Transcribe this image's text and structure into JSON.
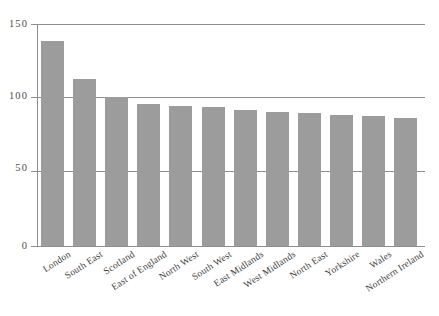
{
  "chart_data": {
    "type": "bar",
    "title": "",
    "subtitle": "",
    "xlabel": "",
    "ylabel": "",
    "ylim": [
      0,
      150
    ],
    "yticks": [
      0,
      50,
      100,
      150
    ],
    "ytick_labels": [
      "0",
      "50",
      "100",
      "150"
    ],
    "grid": "horizontal",
    "legend": "none",
    "bar_color": "#9c9c9c",
    "axis_color": "#8e8e8e",
    "background": "#ffffff",
    "categories": [
      "London",
      "South East",
      "Scotland",
      "East of England",
      "North West",
      "South West",
      "East Midlands",
      "West Midlands",
      "North East",
      "Yorkshire",
      "Wales",
      "Northern Ireland"
    ],
    "values": [
      139,
      113,
      101,
      96,
      95,
      94,
      92,
      91,
      90,
      89,
      88,
      87
    ]
  }
}
